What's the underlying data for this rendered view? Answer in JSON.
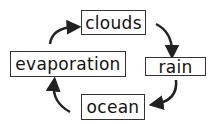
{
  "diagram": {
    "type": "cycle",
    "nodes": [
      {
        "id": "clouds",
        "label": "clouds"
      },
      {
        "id": "rain",
        "label": "rain"
      },
      {
        "id": "ocean",
        "label": "ocean"
      },
      {
        "id": "evaporation",
        "label": "evaporation"
      }
    ],
    "edges": [
      {
        "from": "clouds",
        "to": "rain"
      },
      {
        "from": "rain",
        "to": "ocean"
      },
      {
        "from": "ocean",
        "to": "evaporation"
      },
      {
        "from": "evaporation",
        "to": "clouds"
      }
    ],
    "colors": {
      "stroke": "#222222",
      "background": "#ffffff"
    }
  }
}
